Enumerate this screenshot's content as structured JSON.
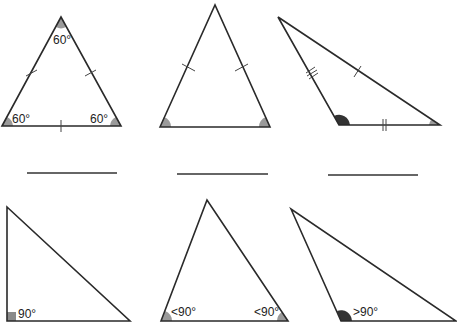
{
  "colors": {
    "edge": "#2a2a2a",
    "acute_mark": "#9a9a9a",
    "obtuse_mark": "#333333",
    "right_mark": "#8a8a8a"
  },
  "triangles": [
    {
      "id": "equilateral",
      "labels": {
        "top": "60°",
        "left": "60°",
        "right": "60°"
      }
    },
    {
      "id": "isosceles",
      "labels": {}
    },
    {
      "id": "scalene",
      "labels": {}
    },
    {
      "id": "right",
      "labels": {
        "right_angle": "90°"
      }
    },
    {
      "id": "acute",
      "labels": {
        "left": "<90°",
        "right": "<90°"
      }
    },
    {
      "id": "obtuse",
      "labels": {
        "obtuse": ">90°"
      }
    }
  ],
  "answer_blanks": [
    {
      "value": ""
    },
    {
      "value": ""
    },
    {
      "value": ""
    }
  ]
}
